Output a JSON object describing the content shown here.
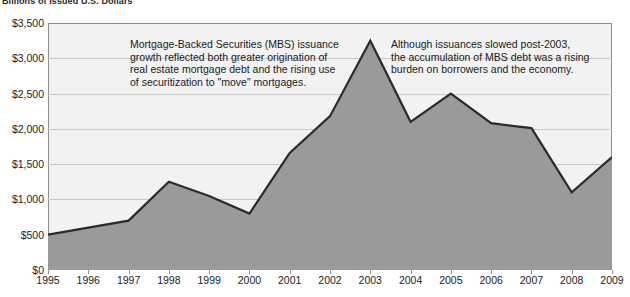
{
  "chart_data": {
    "type": "area",
    "title": "Billions of Issued U.S. Dollars",
    "xlabel": "",
    "ylabel": "",
    "categories": [
      "1995",
      "1996",
      "1997",
      "1998",
      "1999",
      "2000",
      "2001",
      "2002",
      "2003",
      "2004",
      "2005",
      "2006",
      "2007",
      "2008",
      "2009"
    ],
    "values": [
      500,
      600,
      700,
      1250,
      1050,
      800,
      1660,
      2180,
      3250,
      2100,
      2500,
      2080,
      2010,
      1100,
      1600
    ],
    "series": [
      {
        "name": "MBS issuance",
        "values": [
          500,
          600,
          700,
          1250,
          1050,
          800,
          1660,
          2180,
          3250,
          2100,
          2500,
          2080,
          2010,
          1100,
          1600
        ]
      }
    ],
    "ylim": [
      0,
      3500
    ],
    "ytick_values": [
      0,
      500,
      1000,
      1500,
      2000,
      2500,
      3000,
      3500
    ],
    "ytick_labels": [
      "$0",
      "$500",
      "$1,000",
      "$1,500",
      "$2,000",
      "$2,500",
      "$3,000",
      "$3,500"
    ],
    "xtick_labels": [
      "1995",
      "1996",
      "1997",
      "1998",
      "1999",
      "2000",
      "2001",
      "2002",
      "2003",
      "2004",
      "2005",
      "2006",
      "2007",
      "2008",
      "2009"
    ],
    "grid": true,
    "legend": "none",
    "area_fill_color": "#9a9a9a",
    "line_color": "#2b2b2b",
    "plot_background_color": "#f2f2f2",
    "grid_color": "#c9c9c9",
    "annotations": [
      {
        "id": "annotation-left",
        "text": "Mortgage-Backed Securities (MBS) issuance\ngrowth reflected both greater origination of\nreal estate mortgage debt and the rising use\nof securitization to \"move\" mortgages."
      },
      {
        "id": "annotation-right",
        "text": "Although issuances slowed post-2003,\nthe accumulation of MBS debt was a rising\nburden on borrowers and the economy."
      }
    ]
  }
}
